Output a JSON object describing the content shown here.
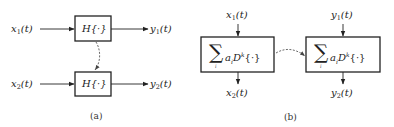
{
  "panel_a": {
    "caption": "(a)",
    "inputs": [
      {
        "var": "x",
        "sub": "1",
        "arg": "(t)"
      },
      {
        "var": "x",
        "sub": "2",
        "arg": "(t)"
      }
    ],
    "outputs": [
      {
        "var": "y",
        "sub": "1",
        "arg": "(t)"
      },
      {
        "var": "y",
        "sub": "2",
        "arg": "(t)"
      }
    ],
    "boxes": [
      {
        "label": "H{·}"
      },
      {
        "label": "H{·}"
      }
    ],
    "connector": "dashed-arrow top box to bottom box"
  },
  "panel_b": {
    "caption": "(b)",
    "inputs": [
      {
        "var": "x",
        "sub": "1",
        "arg": "(t)"
      },
      {
        "var": "y",
        "sub": "1",
        "arg": "(t)"
      }
    ],
    "outputs": [
      {
        "var": "x",
        "sub": "2",
        "arg": "(t)"
      },
      {
        "var": "y",
        "sub": "2",
        "arg": "(t)"
      }
    ],
    "boxes": [
      {
        "sigma": "∑",
        "sigma_sub": "i",
        "label": "a",
        "label_sub": "i",
        "op": "D",
        "op_sup": "k",
        "arg": "{·}"
      },
      {
        "sigma": "∑",
        "sigma_sub": "i",
        "label": "a",
        "label_sub": "i",
        "op": "D",
        "op_sup": "k",
        "arg": "{·}"
      }
    ],
    "connector": "dashed-arrow left box to right box"
  },
  "colors": {
    "line": "#222222",
    "dashed": "#444444",
    "background": "#ffffff"
  }
}
